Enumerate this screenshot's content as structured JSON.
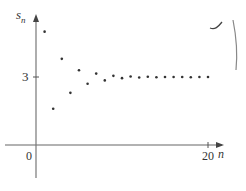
{
  "chart_data": {
    "type": "scatter",
    "title": "",
    "xlabel": "n",
    "ylabel": "s_n",
    "x_ticks": [
      "0",
      "20"
    ],
    "y_ticks": [
      "3"
    ],
    "xlim": [
      0,
      21
    ],
    "ylim": [
      -1.5,
      5.8
    ],
    "grid": false,
    "legend": null,
    "x": [
      1,
      2,
      3,
      4,
      5,
      6,
      7,
      8,
      9,
      10,
      11,
      12,
      13,
      14,
      15,
      16,
      17,
      18,
      19,
      20
    ],
    "values": [
      5.0,
      1.6,
      3.8,
      2.3,
      3.3,
      2.7,
      3.15,
      2.85,
      3.05,
      2.95,
      3.02,
      2.98,
      3.01,
      2.99,
      3.0,
      3.0,
      3.0,
      2.99,
      3.0,
      3.0
    ],
    "annotations": [
      "converges to 3"
    ]
  },
  "labels": {
    "y_axis": "s",
    "y_axis_sub": "n",
    "x_axis": "n",
    "origin": "0",
    "x_tick_20": "20",
    "y_tick_3": "3"
  }
}
